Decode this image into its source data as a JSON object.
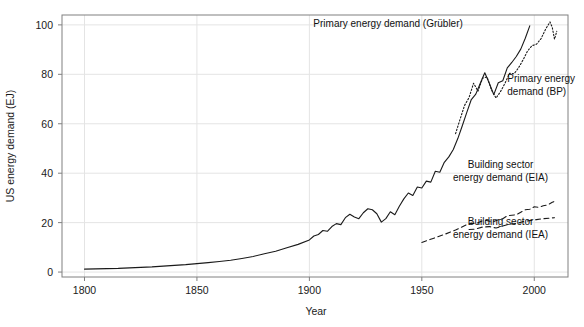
{
  "chart_data": {
    "type": "line",
    "title": "",
    "xlabel": "Year",
    "ylabel": "US energy demand (EJ)",
    "xlim": [
      1790,
      2015
    ],
    "ylim": [
      -2,
      104
    ],
    "xticks": [
      1800,
      1850,
      1900,
      1950,
      2000
    ],
    "xtick_labels": [
      "1800",
      "1850",
      "1900",
      "1950",
      "2000"
    ],
    "yticks": [
      0,
      20,
      40,
      60,
      80,
      100
    ],
    "ytick_labels": [
      "0",
      "20",
      "40",
      "60",
      "80",
      "100"
    ],
    "grid": true,
    "legend": "none (inline annotations)",
    "annotations": [
      {
        "name": "primary-energy-grubler-label",
        "lines": [
          "Primary energy demand (Grübler)"
        ],
        "x": 1935,
        "y": 99,
        "anchor": "middle"
      },
      {
        "name": "primary-energy-bp-label",
        "lines": [
          "Primary energy",
          "demand (BP)"
        ],
        "x": 1988,
        "y": 77,
        "anchor": "start"
      },
      {
        "name": "building-sector-eia-label",
        "lines": [
          "Building sector",
          "energy demand (EIA)"
        ],
        "x": 1985,
        "y": 42,
        "anchor": "middle"
      },
      {
        "name": "building-sector-iea-label",
        "lines": [
          "Building sector",
          "energy demand (IEA)"
        ],
        "x": 1985,
        "y": 19,
        "anchor": "middle"
      }
    ],
    "colors": {
      "line": "#1a1a1a",
      "grid": "#e4e4e4",
      "frame": "#808080",
      "background": "#ffffff",
      "text": "#1a1a1a"
    },
    "series": [
      {
        "name": "Primary energy demand (Grübler)",
        "style": "solid",
        "x": [
          1800,
          1805,
          1810,
          1815,
          1820,
          1825,
          1830,
          1835,
          1840,
          1845,
          1850,
          1855,
          1860,
          1865,
          1870,
          1875,
          1880,
          1885,
          1890,
          1895,
          1900,
          1902,
          1904,
          1906,
          1908,
          1910,
          1912,
          1914,
          1916,
          1918,
          1920,
          1922,
          1924,
          1926,
          1928,
          1930,
          1932,
          1934,
          1936,
          1938,
          1940,
          1942,
          1944,
          1946,
          1948,
          1950,
          1952,
          1954,
          1956,
          1958,
          1960,
          1962,
          1964,
          1966,
          1968,
          1970,
          1972,
          1974,
          1976,
          1978,
          1980,
          1982,
          1984,
          1986,
          1988,
          1990,
          1992,
          1994,
          1996,
          1998
        ],
        "y": [
          1.2,
          1.3,
          1.4,
          1.5,
          1.7,
          1.9,
          2.1,
          2.4,
          2.7,
          3.0,
          3.4,
          3.8,
          4.3,
          4.8,
          5.5,
          6.3,
          7.4,
          8.4,
          9.8,
          11.2,
          13.0,
          14.6,
          15.2,
          16.8,
          16.5,
          18.4,
          19.6,
          19.2,
          22.0,
          23.4,
          22.3,
          21.6,
          24.0,
          25.6,
          25.2,
          23.6,
          20.2,
          21.6,
          24.4,
          23.2,
          26.6,
          29.6,
          32.0,
          31.0,
          34.4,
          34.0,
          36.8,
          36.4,
          40.8,
          40.4,
          44.4,
          46.6,
          49.6,
          54.0,
          59.2,
          64.6,
          69.8,
          72.0,
          76.4,
          80.6,
          76.4,
          71.8,
          76.6,
          77.4,
          82.6,
          84.8,
          87.2,
          90.2,
          94.6,
          99.6
        ]
      },
      {
        "name": "Primary energy demand (BP)",
        "style": "dotted",
        "x": [
          1965,
          1967,
          1969,
          1971,
          1973,
          1975,
          1977,
          1979,
          1981,
          1983,
          1985,
          1987,
          1989,
          1991,
          1993,
          1995,
          1997,
          1999,
          2001,
          2003,
          2005,
          2007,
          2008,
          2009,
          2010
        ],
        "y": [
          56.0,
          61.8,
          67.4,
          70.6,
          76.4,
          73.2,
          78.4,
          79.0,
          73.6,
          70.4,
          73.0,
          76.4,
          80.4,
          80.2,
          82.6,
          85.8,
          89.4,
          91.6,
          92.2,
          94.4,
          98.2,
          101.2,
          99.0,
          94.2,
          97.4
        ]
      },
      {
        "name": "Building sector energy demand (EIA)",
        "style": "dashed",
        "x": [
          1950,
          1955,
          1960,
          1965,
          1970,
          1972,
          1974,
          1976,
          1978,
          1980,
          1982,
          1984,
          1986,
          1988,
          1990,
          1992,
          1994,
          1996,
          1998,
          2000,
          2002,
          2004,
          2006,
          2008,
          2010
        ],
        "y": [
          12.0,
          13.6,
          15.2,
          17.0,
          19.2,
          19.8,
          19.6,
          20.4,
          21.0,
          20.6,
          20.4,
          21.2,
          21.6,
          22.8,
          23.0,
          23.2,
          24.2,
          25.2,
          25.4,
          26.4,
          26.2,
          26.8,
          27.2,
          28.2,
          29.0
        ]
      },
      {
        "name": "Building sector energy demand (IEA)",
        "style": "dashed",
        "x": [
          1971,
          1974,
          1977,
          1980,
          1983,
          1986,
          1989,
          1992,
          1995,
          1998,
          2001,
          2004,
          2007,
          2009
        ],
        "y": [
          17.2,
          17.4,
          18.2,
          18.4,
          17.8,
          18.6,
          19.4,
          19.6,
          20.4,
          20.8,
          21.2,
          21.6,
          21.8,
          22.0
        ]
      }
    ]
  }
}
